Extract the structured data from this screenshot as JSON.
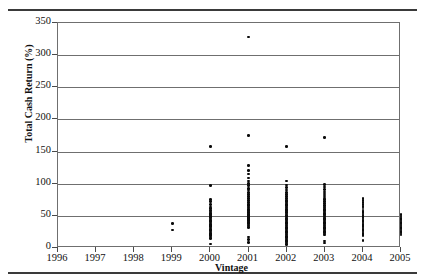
{
  "chart_data": {
    "type": "scatter",
    "title": "",
    "xlabel": "Vintage",
    "ylabel": "Total Cash Return (%)",
    "xlim": [
      1996,
      2005
    ],
    "ylim": [
      0,
      350
    ],
    "ytick_labels": [
      "0",
      "50",
      "100",
      "150",
      "200",
      "250",
      "300",
      "350"
    ],
    "ytick_values": [
      0,
      50,
      100,
      150,
      200,
      250,
      300,
      350
    ],
    "xtick_labels": [
      "1996",
      "1997",
      "1998",
      "1999",
      "2000",
      "2001",
      "2002",
      "2003",
      "2004",
      "2005"
    ],
    "xtick_values": [
      1996,
      1997,
      1998,
      1999,
      2000,
      2001,
      2002,
      2003,
      2004,
      2005
    ],
    "grid": true,
    "legend": false,
    "marker_color": "#0b0b0b",
    "series": [
      {
        "name": "Funds",
        "points": [
          [
            1999,
            38
          ],
          [
            1999,
            28
          ],
          [
            2000,
            158
          ],
          [
            2000,
            97
          ],
          [
            2000,
            75
          ],
          [
            2000,
            72
          ],
          [
            2000,
            68
          ],
          [
            2000,
            64
          ],
          [
            2000,
            61
          ],
          [
            2000,
            58
          ],
          [
            2000,
            56
          ],
          [
            2000,
            54
          ],
          [
            2000,
            52
          ],
          [
            2000,
            50
          ],
          [
            2000,
            49
          ],
          [
            2000,
            47
          ],
          [
            2000,
            45
          ],
          [
            2000,
            43
          ],
          [
            2000,
            41
          ],
          [
            2000,
            39
          ],
          [
            2000,
            37
          ],
          [
            2000,
            35
          ],
          [
            2000,
            33
          ],
          [
            2000,
            31
          ],
          [
            2000,
            29
          ],
          [
            2000,
            27
          ],
          [
            2000,
            25
          ],
          [
            2000,
            23
          ],
          [
            2000,
            21
          ],
          [
            2000,
            19
          ],
          [
            2000,
            17
          ],
          [
            2000,
            15
          ],
          [
            2000,
            6
          ],
          [
            2001,
            328
          ],
          [
            2001,
            175
          ],
          [
            2001,
            128
          ],
          [
            2001,
            121
          ],
          [
            2001,
            115
          ],
          [
            2001,
            109
          ],
          [
            2001,
            104
          ],
          [
            2001,
            100
          ],
          [
            2001,
            97
          ],
          [
            2001,
            93
          ],
          [
            2001,
            90
          ],
          [
            2001,
            86
          ],
          [
            2001,
            83
          ],
          [
            2001,
            80
          ],
          [
            2001,
            77
          ],
          [
            2001,
            74
          ],
          [
            2001,
            71
          ],
          [
            2001,
            68
          ],
          [
            2001,
            66
          ],
          [
            2001,
            64
          ],
          [
            2001,
            62
          ],
          [
            2001,
            60
          ],
          [
            2001,
            58
          ],
          [
            2001,
            56
          ],
          [
            2001,
            55
          ],
          [
            2001,
            53
          ],
          [
            2001,
            52
          ],
          [
            2001,
            51
          ],
          [
            2001,
            50
          ],
          [
            2001,
            49
          ],
          [
            2001,
            48
          ],
          [
            2001,
            47
          ],
          [
            2001,
            46
          ],
          [
            2001,
            45
          ],
          [
            2001,
            44
          ],
          [
            2001,
            43
          ],
          [
            2001,
            42
          ],
          [
            2001,
            40
          ],
          [
            2001,
            38
          ],
          [
            2001,
            36
          ],
          [
            2001,
            34
          ],
          [
            2001,
            32
          ],
          [
            2001,
            17
          ],
          [
            2001,
            13
          ],
          [
            2001,
            9
          ],
          [
            2002,
            158
          ],
          [
            2002,
            104
          ],
          [
            2002,
            98
          ],
          [
            2002,
            94
          ],
          [
            2002,
            90
          ],
          [
            2002,
            86
          ],
          [
            2002,
            83
          ],
          [
            2002,
            80
          ],
          [
            2002,
            77
          ],
          [
            2002,
            74
          ],
          [
            2002,
            72
          ],
          [
            2002,
            70
          ],
          [
            2002,
            68
          ],
          [
            2002,
            66
          ],
          [
            2002,
            64
          ],
          [
            2002,
            62
          ],
          [
            2002,
            60
          ],
          [
            2002,
            58
          ],
          [
            2002,
            56
          ],
          [
            2002,
            55
          ],
          [
            2002,
            53
          ],
          [
            2002,
            51
          ],
          [
            2002,
            50
          ],
          [
            2002,
            48
          ],
          [
            2002,
            46
          ],
          [
            2002,
            44
          ],
          [
            2002,
            42
          ],
          [
            2002,
            40
          ],
          [
            2002,
            38
          ],
          [
            2002,
            36
          ],
          [
            2002,
            34
          ],
          [
            2002,
            32
          ],
          [
            2002,
            30
          ],
          [
            2002,
            28
          ],
          [
            2002,
            26
          ],
          [
            2002,
            24
          ],
          [
            2002,
            22
          ],
          [
            2002,
            20
          ],
          [
            2002,
            18
          ],
          [
            2002,
            16
          ],
          [
            2002,
            14
          ],
          [
            2002,
            12
          ],
          [
            2002,
            10
          ],
          [
            2002,
            8
          ],
          [
            2002,
            5
          ],
          [
            2003,
            172
          ],
          [
            2003,
            99
          ],
          [
            2003,
            95
          ],
          [
            2003,
            91
          ],
          [
            2003,
            87
          ],
          [
            2003,
            84
          ],
          [
            2003,
            81
          ],
          [
            2003,
            78
          ],
          [
            2003,
            75
          ],
          [
            2003,
            72
          ],
          [
            2003,
            69
          ],
          [
            2003,
            66
          ],
          [
            2003,
            64
          ],
          [
            2003,
            62
          ],
          [
            2003,
            60
          ],
          [
            2003,
            58
          ],
          [
            2003,
            56
          ],
          [
            2003,
            54
          ],
          [
            2003,
            52
          ],
          [
            2003,
            50
          ],
          [
            2003,
            48
          ],
          [
            2003,
            46
          ],
          [
            2003,
            44
          ],
          [
            2003,
            42
          ],
          [
            2003,
            40
          ],
          [
            2003,
            38
          ],
          [
            2003,
            36
          ],
          [
            2003,
            34
          ],
          [
            2003,
            32
          ],
          [
            2003,
            30
          ],
          [
            2003,
            28
          ],
          [
            2003,
            26
          ],
          [
            2003,
            24
          ],
          [
            2003,
            22
          ],
          [
            2003,
            20
          ],
          [
            2003,
            11
          ],
          [
            2003,
            8
          ],
          [
            2004,
            77
          ],
          [
            2004,
            74
          ],
          [
            2004,
            71
          ],
          [
            2004,
            68
          ],
          [
            2004,
            65
          ],
          [
            2004,
            62
          ],
          [
            2004,
            59
          ],
          [
            2004,
            57
          ],
          [
            2004,
            55
          ],
          [
            2004,
            53
          ],
          [
            2004,
            51
          ],
          [
            2004,
            49
          ],
          [
            2004,
            47
          ],
          [
            2004,
            45
          ],
          [
            2004,
            43
          ],
          [
            2004,
            41
          ],
          [
            2004,
            39
          ],
          [
            2004,
            37
          ],
          [
            2004,
            35
          ],
          [
            2004,
            33
          ],
          [
            2004,
            31
          ],
          [
            2004,
            29
          ],
          [
            2004,
            27
          ],
          [
            2004,
            25
          ],
          [
            2004,
            23
          ],
          [
            2004,
            21
          ],
          [
            2004,
            19
          ],
          [
            2004,
            12
          ],
          [
            2005,
            52
          ],
          [
            2005,
            50
          ],
          [
            2005,
            48
          ],
          [
            2005,
            46
          ],
          [
            2005,
            44
          ],
          [
            2005,
            42
          ],
          [
            2005,
            40
          ],
          [
            2005,
            38
          ],
          [
            2005,
            36
          ],
          [
            2005,
            34
          ],
          [
            2005,
            32
          ],
          [
            2005,
            30
          ],
          [
            2005,
            28
          ],
          [
            2005,
            26
          ],
          [
            2005,
            24
          ],
          [
            2005,
            22
          ],
          [
            2005,
            20
          ]
        ]
      }
    ]
  }
}
